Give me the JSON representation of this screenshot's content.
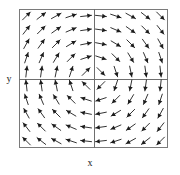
{
  "figure": {
    "kind": "vector-field-plot",
    "width": 180,
    "height": 175,
    "background_color": "#ffffff"
  },
  "axes": {
    "x_label": "x",
    "y_label": "y",
    "frame": {
      "left": 19,
      "top": 9,
      "right": 168,
      "bottom": 148,
      "border_color": "#7a7a7a",
      "border_width": 1,
      "fill_color": "#ffffff"
    },
    "divider": {
      "x": 94,
      "y": 79,
      "color": "#6e6e6e",
      "width": 1,
      "description": "crosshair splitting plot into four quadrants"
    },
    "ticks": [],
    "tick_labels": [],
    "grid": false
  },
  "chart_data": {
    "type": "quiver",
    "title": "",
    "subtitle": "",
    "xlabel": "x",
    "ylabel": "y",
    "xlim": [
      -1,
      1
    ],
    "ylim": [
      -1,
      1
    ],
    "grid": false,
    "legend": null,
    "annotations": [],
    "arrow_color": "#1c1c1c",
    "arrow_count": 100,
    "grid_shape": [
      10,
      10
    ],
    "x": [
      -0.9,
      -0.7,
      -0.5,
      -0.3,
      -0.1,
      0.1,
      0.3,
      0.5,
      0.7,
      0.9
    ],
    "y": [
      0.9,
      0.7,
      0.5,
      0.3,
      0.1,
      -0.1,
      -0.3,
      -0.5,
      -0.7,
      -0.9
    ],
    "field_formula": "u = y, v = x",
    "quadrants": [
      {
        "name": "upper-left",
        "x_range": [
          -1,
          0
        ],
        "y_range": [
          0,
          1
        ],
        "general_direction": "up-right / northeast"
      },
      {
        "name": "upper-right",
        "x_range": [
          0,
          1
        ],
        "y_range": [
          0,
          1
        ],
        "general_direction": "down-right / southeast"
      },
      {
        "name": "lower-left",
        "x_range": [
          -1,
          0
        ],
        "y_range": [
          -1,
          0
        ],
        "general_direction": "up-left / northwest"
      },
      {
        "name": "lower-right",
        "x_range": [
          0,
          1
        ],
        "y_range": [
          -1,
          0
        ],
        "general_direction": "up-right / northeast"
      }
    ],
    "vectors": [
      {
        "x": -0.9,
        "y": 0.9,
        "u": 0.9,
        "v": 0.9
      },
      {
        "x": -0.7,
        "y": 0.9,
        "u": 0.9,
        "v": 0.7
      },
      {
        "x": -0.5,
        "y": 0.9,
        "u": 0.9,
        "v": 0.5
      },
      {
        "x": -0.3,
        "y": 0.9,
        "u": 0.9,
        "v": 0.3
      },
      {
        "x": -0.1,
        "y": 0.9,
        "u": 0.9,
        "v": 0.1
      },
      {
        "x": 0.1,
        "y": 0.9,
        "u": 0.9,
        "v": -0.1
      },
      {
        "x": 0.3,
        "y": 0.9,
        "u": 0.9,
        "v": -0.3
      },
      {
        "x": 0.5,
        "y": 0.9,
        "u": 0.9,
        "v": -0.5
      },
      {
        "x": 0.7,
        "y": 0.9,
        "u": 0.9,
        "v": -0.7
      },
      {
        "x": 0.9,
        "y": 0.9,
        "u": 0.9,
        "v": -0.9
      },
      {
        "x": -0.9,
        "y": 0.7,
        "u": 0.7,
        "v": 0.9
      },
      {
        "x": -0.7,
        "y": 0.7,
        "u": 0.7,
        "v": 0.7
      },
      {
        "x": -0.5,
        "y": 0.7,
        "u": 0.7,
        "v": 0.5
      },
      {
        "x": -0.3,
        "y": 0.7,
        "u": 0.7,
        "v": 0.3
      },
      {
        "x": -0.1,
        "y": 0.7,
        "u": 0.7,
        "v": 0.1
      },
      {
        "x": 0.1,
        "y": 0.7,
        "u": 0.7,
        "v": -0.1
      },
      {
        "x": 0.3,
        "y": 0.7,
        "u": 0.7,
        "v": -0.3
      },
      {
        "x": 0.5,
        "y": 0.7,
        "u": 0.7,
        "v": -0.5
      },
      {
        "x": 0.7,
        "y": 0.7,
        "u": 0.7,
        "v": -0.7
      },
      {
        "x": 0.9,
        "y": 0.7,
        "u": 0.7,
        "v": -0.9
      },
      {
        "x": -0.9,
        "y": 0.5,
        "u": 0.5,
        "v": 0.9
      },
      {
        "x": -0.7,
        "y": 0.5,
        "u": 0.5,
        "v": 0.7
      },
      {
        "x": -0.5,
        "y": 0.5,
        "u": 0.5,
        "v": 0.5
      },
      {
        "x": -0.3,
        "y": 0.5,
        "u": 0.5,
        "v": 0.3
      },
      {
        "x": -0.1,
        "y": 0.5,
        "u": 0.5,
        "v": 0.1
      },
      {
        "x": 0.1,
        "y": 0.5,
        "u": 0.5,
        "v": -0.1
      },
      {
        "x": 0.3,
        "y": 0.5,
        "u": 0.5,
        "v": -0.3
      },
      {
        "x": 0.5,
        "y": 0.5,
        "u": 0.5,
        "v": -0.5
      },
      {
        "x": 0.7,
        "y": 0.5,
        "u": 0.5,
        "v": -0.7
      },
      {
        "x": 0.9,
        "y": 0.5,
        "u": 0.5,
        "v": -0.9
      },
      {
        "x": -0.9,
        "y": 0.3,
        "u": 0.3,
        "v": 0.9
      },
      {
        "x": -0.7,
        "y": 0.3,
        "u": 0.3,
        "v": 0.7
      },
      {
        "x": -0.5,
        "y": 0.3,
        "u": 0.3,
        "v": 0.5
      },
      {
        "x": -0.3,
        "y": 0.3,
        "u": 0.3,
        "v": 0.3
      },
      {
        "x": -0.1,
        "y": 0.3,
        "u": 0.3,
        "v": 0.1
      },
      {
        "x": 0.1,
        "y": 0.3,
        "u": 0.3,
        "v": -0.1
      },
      {
        "x": 0.3,
        "y": 0.3,
        "u": 0.3,
        "v": -0.3
      },
      {
        "x": 0.5,
        "y": 0.3,
        "u": 0.3,
        "v": -0.5
      },
      {
        "x": 0.7,
        "y": 0.3,
        "u": 0.3,
        "v": -0.7
      },
      {
        "x": 0.9,
        "y": 0.3,
        "u": 0.3,
        "v": -0.9
      },
      {
        "x": -0.9,
        "y": 0.1,
        "u": 0.1,
        "v": 0.9
      },
      {
        "x": -0.7,
        "y": 0.1,
        "u": 0.1,
        "v": 0.7
      },
      {
        "x": -0.5,
        "y": 0.1,
        "u": 0.1,
        "v": 0.5
      },
      {
        "x": -0.3,
        "y": 0.1,
        "u": 0.1,
        "v": 0.3
      },
      {
        "x": -0.1,
        "y": 0.1,
        "u": 0.1,
        "v": 0.1
      },
      {
        "x": 0.1,
        "y": 0.1,
        "u": 0.1,
        "v": -0.1
      },
      {
        "x": 0.3,
        "y": 0.1,
        "u": 0.1,
        "v": -0.3
      },
      {
        "x": 0.5,
        "y": 0.1,
        "u": 0.1,
        "v": -0.5
      },
      {
        "x": 0.7,
        "y": 0.1,
        "u": 0.1,
        "v": -0.7
      },
      {
        "x": 0.9,
        "y": 0.1,
        "u": 0.1,
        "v": -0.9
      },
      {
        "x": -0.9,
        "y": -0.1,
        "u": -0.1,
        "v": 0.9
      },
      {
        "x": -0.7,
        "y": -0.1,
        "u": -0.1,
        "v": 0.7
      },
      {
        "x": -0.5,
        "y": -0.1,
        "u": -0.1,
        "v": 0.5
      },
      {
        "x": -0.3,
        "y": -0.1,
        "u": -0.1,
        "v": 0.3
      },
      {
        "x": -0.1,
        "y": -0.1,
        "u": -0.1,
        "v": 0.1
      },
      {
        "x": 0.1,
        "y": -0.1,
        "u": -0.1,
        "v": -0.1
      },
      {
        "x": 0.3,
        "y": -0.1,
        "u": -0.1,
        "v": -0.3
      },
      {
        "x": 0.5,
        "y": -0.1,
        "u": -0.1,
        "v": -0.5
      },
      {
        "x": 0.7,
        "y": -0.1,
        "u": -0.1,
        "v": -0.7
      },
      {
        "x": 0.9,
        "y": -0.1,
        "u": -0.1,
        "v": -0.9
      },
      {
        "x": -0.9,
        "y": -0.3,
        "u": -0.3,
        "v": 0.9
      },
      {
        "x": -0.7,
        "y": -0.3,
        "u": -0.3,
        "v": 0.7
      },
      {
        "x": -0.5,
        "y": -0.3,
        "u": -0.3,
        "v": 0.5
      },
      {
        "x": -0.3,
        "y": -0.3,
        "u": -0.3,
        "v": 0.3
      },
      {
        "x": -0.1,
        "y": -0.3,
        "u": -0.3,
        "v": 0.1
      },
      {
        "x": 0.1,
        "y": -0.3,
        "u": -0.3,
        "v": -0.1
      },
      {
        "x": 0.3,
        "y": -0.3,
        "u": -0.3,
        "v": -0.3
      },
      {
        "x": 0.5,
        "y": -0.3,
        "u": -0.3,
        "v": -0.5
      },
      {
        "x": 0.7,
        "y": -0.3,
        "u": -0.3,
        "v": -0.7
      },
      {
        "x": 0.9,
        "y": -0.3,
        "u": -0.3,
        "v": -0.9
      },
      {
        "x": -0.9,
        "y": -0.5,
        "u": -0.5,
        "v": 0.9
      },
      {
        "x": -0.7,
        "y": -0.5,
        "u": -0.5,
        "v": 0.7
      },
      {
        "x": -0.5,
        "y": -0.5,
        "u": -0.5,
        "v": 0.5
      },
      {
        "x": -0.3,
        "y": -0.5,
        "u": -0.5,
        "v": 0.3
      },
      {
        "x": -0.1,
        "y": -0.5,
        "u": -0.5,
        "v": 0.1
      },
      {
        "x": 0.1,
        "y": -0.5,
        "u": -0.5,
        "v": -0.1
      },
      {
        "x": 0.3,
        "y": -0.5,
        "u": -0.5,
        "v": -0.3
      },
      {
        "x": 0.5,
        "y": -0.5,
        "u": -0.5,
        "v": -0.5
      },
      {
        "x": 0.7,
        "y": -0.5,
        "u": -0.5,
        "v": -0.7
      },
      {
        "x": 0.9,
        "y": -0.5,
        "u": -0.5,
        "v": -0.9
      },
      {
        "x": -0.9,
        "y": -0.7,
        "u": -0.7,
        "v": 0.9
      },
      {
        "x": -0.7,
        "y": -0.7,
        "u": -0.7,
        "v": 0.7
      },
      {
        "x": -0.5,
        "y": -0.7,
        "u": -0.7,
        "v": 0.5
      },
      {
        "x": -0.3,
        "y": -0.7,
        "u": -0.7,
        "v": 0.3
      },
      {
        "x": -0.1,
        "y": -0.7,
        "u": -0.7,
        "v": 0.1
      },
      {
        "x": 0.1,
        "y": -0.7,
        "u": -0.7,
        "v": -0.1
      },
      {
        "x": 0.3,
        "y": -0.7,
        "u": -0.7,
        "v": -0.3
      },
      {
        "x": 0.5,
        "y": -0.7,
        "u": -0.7,
        "v": -0.5
      },
      {
        "x": 0.7,
        "y": -0.7,
        "u": -0.7,
        "v": -0.7
      },
      {
        "x": 0.9,
        "y": -0.7,
        "u": -0.7,
        "v": -0.9
      },
      {
        "x": -0.9,
        "y": -0.9,
        "u": -0.9,
        "v": 0.9
      },
      {
        "x": -0.7,
        "y": -0.9,
        "u": -0.9,
        "v": 0.7
      },
      {
        "x": -0.5,
        "y": -0.9,
        "u": -0.9,
        "v": 0.5
      },
      {
        "x": -0.3,
        "y": -0.9,
        "u": -0.9,
        "v": 0.3
      },
      {
        "x": -0.1,
        "y": -0.9,
        "u": -0.9,
        "v": 0.1
      },
      {
        "x": 0.1,
        "y": -0.9,
        "u": -0.9,
        "v": -0.1
      },
      {
        "x": 0.3,
        "y": -0.9,
        "u": -0.9,
        "v": -0.3
      },
      {
        "x": 0.5,
        "y": -0.9,
        "u": -0.9,
        "v": -0.5
      },
      {
        "x": 0.7,
        "y": -0.9,
        "u": -0.9,
        "v": -0.7
      },
      {
        "x": 0.9,
        "y": -0.9,
        "u": -0.9,
        "v": -0.9
      }
    ]
  }
}
